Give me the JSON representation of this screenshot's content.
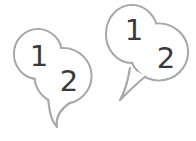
{
  "illustration": {
    "description": "two numbered speech bubbles",
    "colors": {
      "outline": "#a8a8a8",
      "digit": "#3a3a3a",
      "fill": "#ffffff",
      "background": "#ffffff"
    },
    "bubbles": [
      {
        "name": "left-speech-bubble",
        "position": "lower-left",
        "labels": {
          "small_lobe": "1",
          "large_lobe": "2"
        }
      },
      {
        "name": "right-speech-bubble",
        "position": "upper-right",
        "labels": {
          "small_lobe": "1",
          "large_lobe": "2"
        }
      }
    ]
  }
}
